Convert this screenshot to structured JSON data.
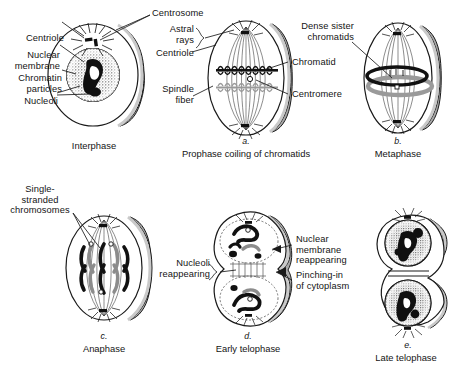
{
  "figure": {
    "colors": {
      "outline": "#1a1a1a",
      "side_shading": "#a8a8a8",
      "chromosome_dark": "#111111",
      "chromosome_gray": "#8c8c8c",
      "nucleus_stipple": "#5a5a5a",
      "background": "#ffffff"
    }
  },
  "panels": [
    {
      "id": "interphase",
      "letter": "",
      "caption": "Interphase",
      "labels": [
        {
          "name": "centriole",
          "text": "Centriole"
        },
        {
          "name": "nuclear-membrane",
          "text": "Nuclear\nmembrane"
        },
        {
          "name": "chromatin-particles",
          "text": "Chromatin\nparticles"
        },
        {
          "name": "nucleoli",
          "text": "Nucleoli"
        },
        {
          "name": "centrosome",
          "text": "Centrosome"
        }
      ]
    },
    {
      "id": "prophase",
      "letter": "a.",
      "caption": "Prophase coiling of chromatids",
      "labels": [
        {
          "name": "astral-rays",
          "text": "Astral\nrays"
        },
        {
          "name": "centriole",
          "text": "Centriole"
        },
        {
          "name": "spindle-fiber",
          "text": "Spindle\nfiber"
        },
        {
          "name": "chromatid",
          "text": "Chromatid"
        },
        {
          "name": "centromere",
          "text": "Centromere"
        }
      ]
    },
    {
      "id": "metaphase",
      "letter": "b.",
      "caption": "Metaphase",
      "labels": [
        {
          "name": "dense-sister-chromatids",
          "text": "Dense sister\nchromatids"
        }
      ]
    },
    {
      "id": "anaphase",
      "letter": "c.",
      "caption": "Anaphase",
      "labels": [
        {
          "name": "single-stranded-chromosomes",
          "text": "Single-\nstranded\nchromosomes"
        }
      ]
    },
    {
      "id": "early-telophase",
      "letter": "d.",
      "caption": "Early telophase",
      "labels": [
        {
          "name": "nucleoli-reappearing",
          "text": "Nucleoli\nreappearing"
        },
        {
          "name": "nuclear-membrane-reappearing",
          "text": "Nuclear\nmembrane\nreappearing"
        },
        {
          "name": "pinching-in-of-cytoplasm",
          "text": "Pinching-in\nof cytoplasm"
        }
      ]
    },
    {
      "id": "late-telophase",
      "letter": "e.",
      "caption": "Late telophase",
      "labels": []
    }
  ],
  "label_text": {
    "centrosome": "Centrosome",
    "centriole_1": "Centriole",
    "nuclear_membrane": "Nuclear\nmembrane",
    "chromatin_particles": "Chromatin\nparticles",
    "nucleoli": "Nucleoli",
    "astral_rays": "Astral\nrays",
    "centriole_2": "Centriole",
    "spindle_fiber": "Spindle\nfiber",
    "chromatid": "Chromatid",
    "centromere": "Centromere",
    "dense_sister_chromatids": "Dense sister\nchromatids",
    "single_stranded_chromosomes": "Single-\nstranded\nchromosomes",
    "nucleoli_reappearing": "Nucleoli\nreappearing",
    "nuclear_membrane_reappearing": "Nuclear\nmembrane\nreappearing",
    "pinching_in_of_cytoplasm": "Pinching-in\nof cytoplasm"
  },
  "captions": {
    "interphase": "Interphase",
    "prophase_letter": "a.",
    "prophase": "Prophase coiling of chromatids",
    "metaphase_letter": "b.",
    "metaphase": "Metaphase",
    "anaphase_letter": "c.",
    "anaphase": "Anaphase",
    "early_telophase_letter": "d.",
    "early_telophase": "Early telophase",
    "late_telophase_letter": "e.",
    "late_telophase": "Late telophase"
  }
}
